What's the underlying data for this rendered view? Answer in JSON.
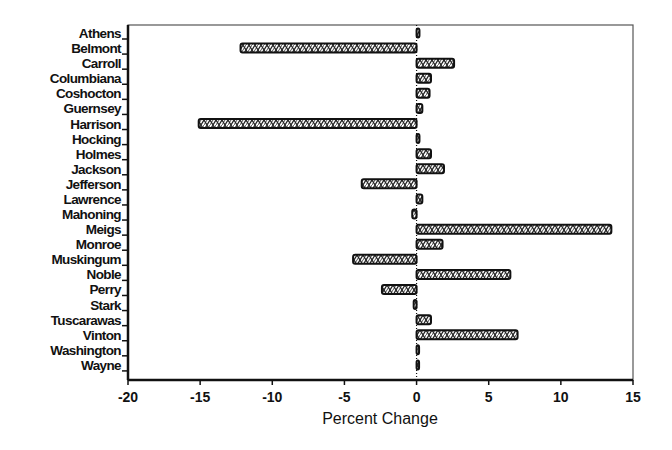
{
  "chart_data": {
    "type": "bar",
    "orientation": "horizontal",
    "title": "",
    "xlabel": "Percent Change",
    "ylabel": "",
    "xlim": [
      -20,
      15
    ],
    "xticks": [
      -20,
      -15,
      -10,
      -5,
      0,
      5,
      10,
      15
    ],
    "grid": false,
    "legend": null,
    "categories": [
      "Athens",
      "Belmont",
      "Carroll",
      "Columbiana",
      "Coshocton",
      "Guernsey",
      "Harrison",
      "Hocking",
      "Holmes",
      "Jackson",
      "Jefferson",
      "Lawrence",
      "Mahoning",
      "Meigs",
      "Monroe",
      "Muskingum",
      "Noble",
      "Perry",
      "Stark",
      "Tuscarawas",
      "Vinton",
      "Washington",
      "Wayne"
    ],
    "values": [
      0.2,
      -12.2,
      2.6,
      1.0,
      0.9,
      0.4,
      -15.1,
      0.2,
      1.0,
      1.9,
      -3.8,
      0.4,
      -0.3,
      13.5,
      1.8,
      -4.4,
      6.5,
      -2.4,
      -0.2,
      1.0,
      7.0,
      0.1,
      0.1
    ]
  },
  "style": {
    "bar_fill": "#ffffff",
    "bar_stroke": "#111111",
    "pattern_color": "#222222",
    "axis_color": "#111111"
  }
}
